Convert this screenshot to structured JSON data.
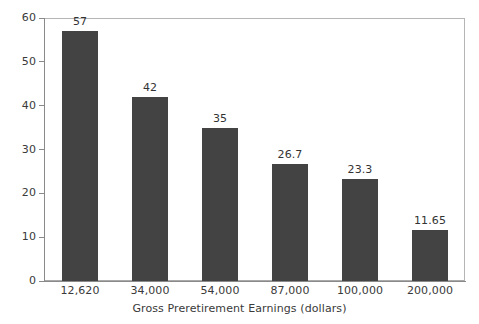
{
  "chart_data": {
    "type": "bar",
    "title": "",
    "subtitle": "",
    "xlabel": "Gross Preretirement Earnings (dollars)",
    "ylabel": "",
    "categories": [
      "12,620",
      "34,000",
      "54,000",
      "87,000",
      "100,000",
      "200,000"
    ],
    "values": [
      57,
      42,
      35,
      26.7,
      23.3,
      11.65
    ],
    "value_labels": [
      "57",
      "42",
      "35",
      "26.7",
      "23.3",
      "11.65"
    ],
    "ylim": [
      0,
      60
    ],
    "yticks": [
      0,
      10,
      20,
      30,
      40,
      50,
      60
    ],
    "ytick_labels": [
      "0",
      "10",
      "20",
      "30",
      "40",
      "50",
      "60"
    ],
    "grid": false,
    "legend": null,
    "legend_position": "none",
    "series": [
      {
        "name": "Replacement rate",
        "values": [
          57,
          42,
          35,
          26.7,
          23.3,
          11.65
        ],
        "color": "#434343"
      }
    ]
  },
  "colors": {
    "bar": "#434343",
    "axis": "#8a8a8a",
    "frame": "#b5b5b5",
    "text": "#3a3a3a",
    "background": "#ffffff"
  }
}
